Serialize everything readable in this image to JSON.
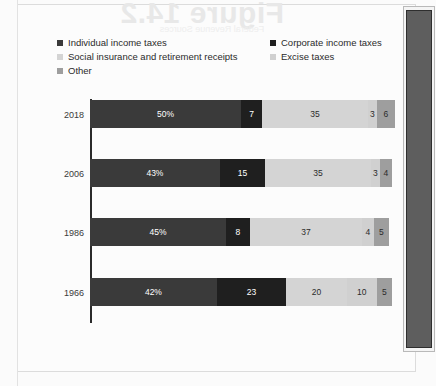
{
  "page": {
    "ghost_headline": "Figure 14.2",
    "ghost_subline": "Federal Revenue Sources"
  },
  "chart_data": {
    "type": "bar",
    "subtype": "stacked-horizontal-100pct",
    "title": "",
    "xlabel": "",
    "ylabel": "",
    "categories": [
      "2018",
      "2006",
      "1986",
      "1966"
    ],
    "series": [
      {
        "name": "Individual income taxes",
        "color": "#3a3a3a",
        "text_color": "#ffffff",
        "values": [
          50,
          43,
          45,
          42
        ]
      },
      {
        "name": "Corporate income taxes",
        "color": "#1f1f1f",
        "text_color": "#ffffff",
        "values": [
          7,
          15,
          8,
          23
        ]
      },
      {
        "name": "Social insurance and retirement receipts",
        "color": "#d4d4d4",
        "text_color": "#2b2b2b",
        "values": [
          35,
          35,
          37,
          20
        ]
      },
      {
        "name": "Excise taxes",
        "color": "#d0d0d0",
        "text_color": "#2b2b2b",
        "values": [
          3,
          3,
          4,
          10
        ]
      },
      {
        "name": "Other",
        "color": "#9e9e9e",
        "text_color": "#2b2b2b",
        "values": [
          6,
          4,
          5,
          5
        ]
      }
    ],
    "value_labels": [
      [
        "50%",
        "7",
        "35",
        "3",
        "6"
      ],
      [
        "43%",
        "15",
        "35",
        "3",
        "4"
      ],
      [
        "45%",
        "8",
        "37",
        "4",
        "5"
      ],
      [
        "42%",
        "23",
        "20",
        "10",
        "5"
      ]
    ],
    "xlim": [
      0,
      101
    ],
    "grid": false,
    "legend_position": "top"
  },
  "legend": {
    "items": [
      {
        "label": "Individual income taxes",
        "color": "#3a3a3a"
      },
      {
        "label": "Social insurance and retirement receipts",
        "color": "#d4d4d4"
      },
      {
        "label": "Other",
        "color": "#9e9e9e"
      },
      {
        "label": "Corporate income taxes",
        "color": "#1f1f1f"
      },
      {
        "label": "Excise taxes",
        "color": "#d0d0d0"
      }
    ]
  }
}
